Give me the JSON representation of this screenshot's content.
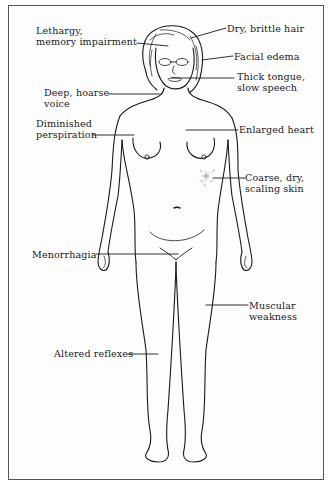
{
  "diagram": {
    "type": "anatomical-callout-illustration",
    "colors": {
      "ink": "#1a1a1a",
      "border": "#555555",
      "background": "#fdfdfd"
    },
    "labels": [
      {
        "id": "lethargy",
        "line1": "Lethargy,",
        "line2": "memory impairment",
        "side": "left"
      },
      {
        "id": "voice",
        "line1": "Deep, hoarse",
        "line2": "voice",
        "side": "left"
      },
      {
        "id": "perspiration",
        "line1": "Diminished",
        "line2": "perspiration",
        "side": "left"
      },
      {
        "id": "menorrhagia",
        "line1": "Menorrhagia",
        "line2": "",
        "side": "left"
      },
      {
        "id": "reflexes",
        "line1": "Altered reflexes",
        "line2": "",
        "side": "left"
      },
      {
        "id": "hair",
        "line1": "Dry, brittle hair",
        "line2": "",
        "side": "right"
      },
      {
        "id": "edema",
        "line1": "Facial edema",
        "line2": "",
        "side": "right"
      },
      {
        "id": "tongue",
        "line1": "Thick tongue,",
        "line2": "slow speech",
        "side": "right"
      },
      {
        "id": "heart",
        "line1": "Enlarged heart",
        "line2": "",
        "side": "right"
      },
      {
        "id": "skin",
        "line1": "Coarse, dry,",
        "line2": "scaling skin",
        "side": "right"
      },
      {
        "id": "weakness",
        "line1": "Muscular",
        "line2": "weakness",
        "side": "right"
      }
    ]
  }
}
